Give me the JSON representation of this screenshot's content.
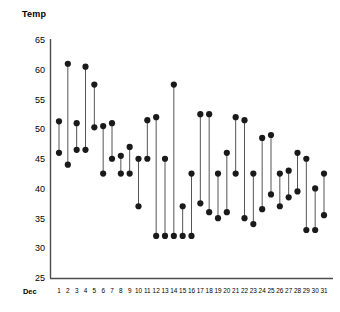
{
  "chart_data": {
    "type": "line",
    "subtype": "dumbbell-range",
    "title": "",
    "ylabel": "Temp",
    "xlabel": "Dec",
    "ylim": [
      25,
      65
    ],
    "yticks": [
      25,
      30,
      35,
      40,
      45,
      50,
      55,
      60,
      65
    ],
    "grid": false,
    "legend_position": "none",
    "x": [
      1,
      2,
      3,
      4,
      5,
      6,
      7,
      8,
      9,
      10,
      11,
      12,
      13,
      14,
      15,
      16,
      17,
      18,
      19,
      20,
      21,
      22,
      23,
      24,
      25,
      26,
      27,
      28,
      29,
      30,
      31
    ],
    "xtick_labels": [
      "1",
      "2",
      "3",
      "4",
      "5",
      "6",
      "7",
      "8",
      "9",
      "10",
      "11",
      "12",
      "13",
      "14",
      "15",
      "16",
      "17",
      "18",
      "19",
      "20",
      "21",
      "22",
      "23",
      "24",
      "25",
      "26",
      "27",
      "28",
      "29",
      "30",
      "31"
    ],
    "series": [
      {
        "name": "High",
        "values": [
          51.3,
          61.0,
          51.0,
          60.5,
          57.5,
          50.5,
          51.0,
          45.5,
          47.0,
          45.0,
          51.5,
          52.0,
          45.0,
          57.5,
          37.0,
          42.5,
          52.5,
          52.5,
          42.5,
          46.0,
          52.0,
          51.5,
          42.5,
          48.5,
          49.0,
          42.5,
          43.0,
          46.0,
          45.0,
          40.0,
          42.5
        ]
      },
      {
        "name": "Low",
        "values": [
          46.0,
          44.0,
          46.5,
          46.5,
          50.3,
          42.5,
          45.0,
          42.5,
          42.5,
          37.0,
          45.0,
          32.0,
          32.0,
          32.0,
          32.0,
          32.0,
          37.5,
          36.0,
          35.0,
          36.0,
          42.5,
          35.0,
          34.0,
          36.5,
          39.0,
          37.0,
          38.5,
          39.5,
          33.0,
          33.0,
          35.5
        ]
      }
    ],
    "marker": {
      "shape": "circle",
      "color": "#1a1a1a",
      "size": 3.1
    },
    "line": {
      "color": "#555555",
      "width": 1.0
    },
    "axis_color": "#4d4d4d"
  }
}
